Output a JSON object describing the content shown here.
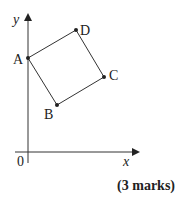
{
  "diagram": {
    "axes": {
      "x_label": "x",
      "y_label": "y",
      "origin_label": "0"
    },
    "points": [
      {
        "name": "A",
        "px": 28,
        "py": 58
      },
      {
        "name": "B",
        "px": 57,
        "py": 105
      },
      {
        "name": "C",
        "px": 104,
        "py": 77
      },
      {
        "name": "D",
        "px": 76,
        "py": 30
      }
    ],
    "shape": "quadrilateral ABCD (square)"
  },
  "footer": {
    "marks": "(3 marks)"
  }
}
